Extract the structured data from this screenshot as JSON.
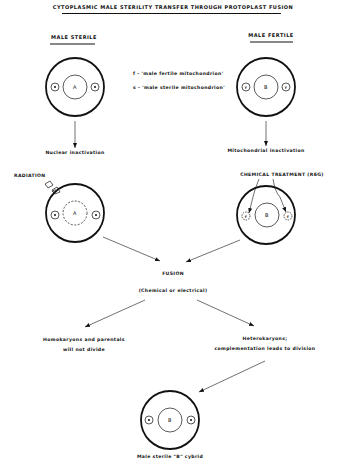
{
  "title": "CYTOPLASMIC MALE STERILITY TRANSFER THROUGH PROTOPLAST FUSION",
  "left_header": "MALE STERILE",
  "right_header": "MALE FERTILE",
  "legend": {
    "fertile": "f - 'male fertile mitochondrion'",
    "sterile": "s - 'male sterile mitochondrion'"
  },
  "cells": {
    "top_left": {
      "nucleus": "A",
      "mito": "s"
    },
    "top_right": {
      "nucleus": "B",
      "mito": "f"
    },
    "mid_left": {
      "nucleus": "A",
      "mito": "s"
    },
    "mid_right": {
      "nucleus": "B",
      "mito": "f"
    },
    "bottom": {
      "nucleus": "B",
      "mito": "s"
    }
  },
  "steps": {
    "nuclear_inactivation": "Nuclear inactivation",
    "mitochondrial_inactivation": "Mitochondrial inactivation",
    "radiation": "RADIATION",
    "chemical_treatment": "CHEMICAL TREATMENT (R6G)",
    "fusion": "FUSION",
    "fusion_method": "(Chemical or electrical)",
    "homokaryons_line1": "Homokaryons and parentals",
    "homokaryons_line2": "will not divide",
    "heterokaryons_line1": "Heterokaryons;",
    "heterokaryons_line2": "complementation leads to division",
    "result": "Male sterile \"B\" cybrid"
  }
}
